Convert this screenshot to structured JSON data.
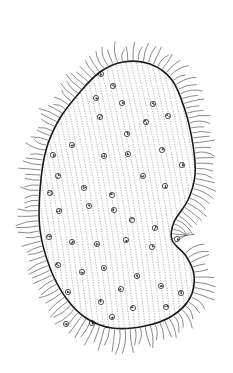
{
  "figure": {
    "style": "pen-and-ink line drawing",
    "colors": {
      "background": "#ffffff",
      "ink": "#1a1a1a",
      "cilia": "#3a3a3a",
      "striation": "#6b6b6b",
      "granule": "#2a2a2a"
    },
    "body_outline": [
      [
        123,
        62
      ],
      [
        150,
        64
      ],
      [
        172,
        80
      ],
      [
        185,
        110
      ],
      [
        193,
        145
      ],
      [
        195,
        175
      ],
      [
        188,
        200
      ],
      [
        174,
        222
      ],
      [
        172,
        240
      ],
      [
        186,
        256
      ],
      [
        194,
        275
      ],
      [
        190,
        298
      ],
      [
        172,
        316
      ],
      [
        145,
        326
      ],
      [
        112,
        328
      ],
      [
        86,
        318
      ],
      [
        66,
        298
      ],
      [
        50,
        268
      ],
      [
        40,
        230
      ],
      [
        40,
        190
      ],
      [
        46,
        150
      ],
      [
        60,
        118
      ],
      [
        80,
        92
      ],
      [
        100,
        72
      ]
    ],
    "granules": [
      [
        101,
        74
      ],
      [
        113,
        86
      ],
      [
        96,
        98
      ],
      [
        122,
        103
      ],
      [
        153,
        104
      ],
      [
        100,
        117
      ],
      [
        146,
        122
      ],
      [
        168,
        116
      ],
      [
        127,
        134
      ],
      [
        72,
        145
      ],
      [
        104,
        156
      ],
      [
        128,
        154
      ],
      [
        162,
        150
      ],
      [
        182,
        165
      ],
      [
        53,
        155
      ],
      [
        58,
        176
      ],
      [
        50,
        193
      ],
      [
        84,
        188
      ],
      [
        112,
        195
      ],
      [
        143,
        176
      ],
      [
        165,
        186
      ],
      [
        59,
        211
      ],
      [
        89,
        206
      ],
      [
        114,
        210
      ],
      [
        132,
        220
      ],
      [
        155,
        228
      ],
      [
        49,
        237
      ],
      [
        72,
        242
      ],
      [
        97,
        244
      ],
      [
        126,
        240
      ],
      [
        152,
        247
      ],
      [
        177,
        239
      ],
      [
        58,
        265
      ],
      [
        82,
        272
      ],
      [
        104,
        268
      ],
      [
        137,
        276
      ],
      [
        161,
        286
      ],
      [
        181,
        293
      ],
      [
        68,
        292
      ],
      [
        101,
        302
      ],
      [
        121,
        289
      ],
      [
        133,
        308
      ],
      [
        112,
        317
      ],
      [
        92,
        323
      ],
      [
        166,
        307
      ],
      [
        66,
        324
      ]
    ],
    "cilia": {
      "count": 140,
      "min_length": 14,
      "max_length": 24
    }
  }
}
